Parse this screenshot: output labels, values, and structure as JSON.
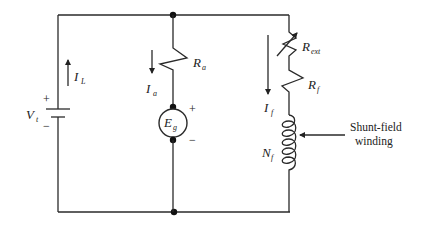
{
  "diagram": {
    "colors": {
      "line": "#2a2a2a",
      "text": "#222222",
      "background": "#ffffff"
    },
    "source": {
      "label": "V",
      "sub": "t",
      "plus": "+",
      "minus": "−"
    },
    "line_current": {
      "label": "I",
      "sub": "L"
    },
    "armature_resistor": {
      "label": "R",
      "sub": "a"
    },
    "armature_current": {
      "label": "I",
      "sub": "a"
    },
    "generator": {
      "label": "E",
      "sub": "g",
      "plus": "+",
      "minus": "−"
    },
    "external_resistor": {
      "label": "R",
      "sub": "ext"
    },
    "field_resistor": {
      "label": "R",
      "sub": "f"
    },
    "field_current": {
      "label": "I",
      "sub": "f"
    },
    "field_winding": {
      "label": "N",
      "sub": "f"
    },
    "annotation": {
      "line1": "Shunt-field",
      "line2": "winding"
    }
  }
}
